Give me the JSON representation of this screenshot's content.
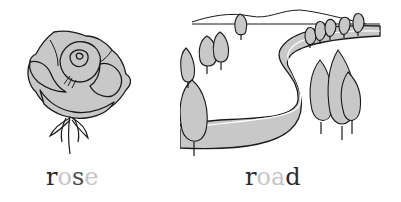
{
  "cards": [
    {
      "image": "rose-illustration",
      "word": "rose",
      "letters": [
        {
          "char": "r",
          "shade": "dark"
        },
        {
          "char": "o",
          "shade": "light"
        },
        {
          "char": "s",
          "shade": "dark"
        },
        {
          "char": "e",
          "shade": "light"
        }
      ]
    },
    {
      "image": "road-illustration",
      "word": "road",
      "letters": [
        {
          "char": "r",
          "shade": "dark"
        },
        {
          "char": "o",
          "shade": "light"
        },
        {
          "char": "a",
          "shade": "light"
        },
        {
          "char": "d",
          "shade": "dark"
        }
      ]
    }
  ],
  "colors": {
    "dark_letter": "#2a2a2a",
    "light_letter": "#c6c6c6",
    "fill_gray": "#c8c8c8",
    "outline": "#1a1a1a"
  }
}
